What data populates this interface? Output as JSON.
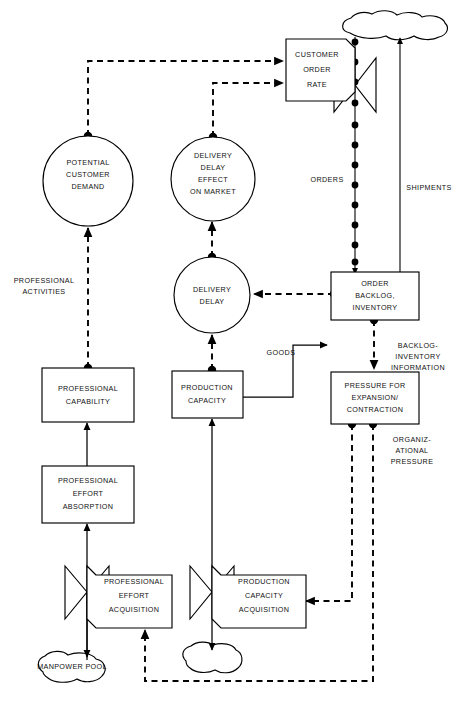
{
  "diagram": {
    "type": "system-dynamics-flow-diagram",
    "background_color": "#ffffff",
    "line_color": "#000000",
    "width": 466,
    "height": 702
  },
  "nodes": {
    "potential_customer_demand": {
      "shape": "circle",
      "lines": [
        "POTENTIAL",
        "CUSTOMER",
        "DEMAND"
      ]
    },
    "delivery_delay_effect_on_market": {
      "shape": "circle",
      "lines": [
        "DELIVERY",
        "DELAY",
        "EFFECT",
        "ON MARKET"
      ]
    },
    "delivery_delay": {
      "shape": "circle",
      "lines": [
        "DELIVERY",
        "DELAY"
      ]
    },
    "customer_order_rate": {
      "shape": "rate-box",
      "lines": [
        "CUSTOMER",
        "ORDER",
        "RATE"
      ]
    },
    "order_backlog_inventory": {
      "shape": "level-box",
      "lines": [
        "ORDER",
        "BACKLOG,",
        "INVENTORY"
      ]
    },
    "pressure_for_expansion_contraction": {
      "shape": "level-box",
      "lines": [
        "PRESSURE FOR",
        "EXPANSION/",
        "CONTRACTION"
      ]
    },
    "professional_capability": {
      "shape": "level-box",
      "lines": [
        "PROFESSIONAL",
        "CAPABILITY"
      ]
    },
    "professional_effort_absorption": {
      "shape": "level-box",
      "lines": [
        "PROFESSIONAL",
        "EFFORT",
        "ABSORPTION"
      ]
    },
    "production_capacity": {
      "shape": "level-box",
      "lines": [
        "PRODUCTION",
        "CAPACITY"
      ]
    },
    "professional_effort_acquisition": {
      "shape": "rate-box",
      "lines": [
        "PROFESSIONAL",
        "EFFORT",
        "ACQUISITION"
      ]
    },
    "production_capacity_acquisition": {
      "shape": "rate-box",
      "lines": [
        "PRODUCTION",
        "CAPACITY",
        "ACQUISITION"
      ]
    },
    "manpower_pool": {
      "shape": "cloud",
      "lines": [
        "MANPOWER POOL"
      ]
    },
    "source_cloud_top": {
      "shape": "cloud",
      "lines": []
    },
    "sink_cloud_bottom": {
      "shape": "cloud",
      "lines": []
    }
  },
  "flow_labels": {
    "orders": "ORDERS",
    "shipments": "SHIPMENTS",
    "goods": "GOODS",
    "professional_activities": [
      "PROFESSIONAL",
      "ACTIVITIES"
    ],
    "backlog_inventory_information": [
      "BACKLOG-",
      "INVENTORY",
      "INFORMATION"
    ],
    "organizational_pressure": [
      "ORGANIZ-",
      "ATIONAL",
      "PRESSURE"
    ]
  },
  "legend": {
    "solid_arrow": "physical flow",
    "dashed_arrow": "information flow",
    "circle": "auxiliary variable",
    "rectangle": "level / state variable",
    "bowtie_valve": "rate / flow control",
    "cloud": "source or sink outside system boundary"
  }
}
